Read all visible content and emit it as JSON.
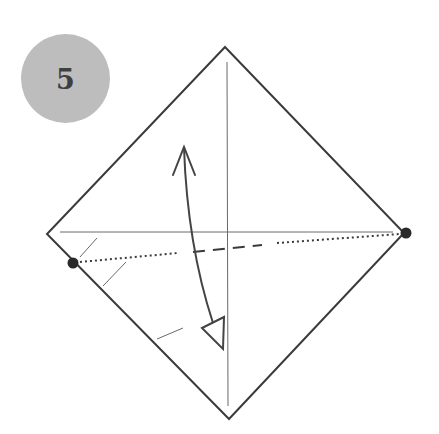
{
  "step": {
    "number": "5",
    "badge_fill": "#bdbdbd",
    "number_color": "#3f3f3f"
  },
  "diagram": {
    "type": "origami-fold-instruction",
    "colors": {
      "outline": "#3a3a3a",
      "crease": "#6a6a6a",
      "fold_line": "#3a3a3a",
      "arrow": "#444444",
      "dot": "#2a2a2a"
    },
    "square": {
      "top": [
        225,
        47
      ],
      "right": [
        404,
        233
      ],
      "bottom": [
        229,
        419
      ],
      "left": [
        47,
        234
      ]
    },
    "creases": {
      "vertical": {
        "from": [
          227,
          62
        ],
        "to": [
          228,
          406
        ]
      },
      "horizontal": {
        "from": [
          60,
          232
        ],
        "to": [
          393,
          232
        ]
      }
    },
    "reference_dots": [
      {
        "name": "left-dot",
        "center": [
          73,
          263
        ],
        "r": 5.5
      },
      {
        "name": "right-dot",
        "center": [
          406,
          233
        ],
        "r": 5.5
      }
    ],
    "fold_line": {
      "dotted_left": {
        "from": [
          80,
          262
        ],
        "to": [
          178,
          253
        ]
      },
      "dashed_middle": {
        "from": [
          193,
          252
        ],
        "to": [
          262,
          245
        ]
      },
      "dotted_right": {
        "from": [
          277,
          243
        ],
        "to": [
          400,
          234
        ]
      }
    },
    "hatch_lines": [
      {
        "from": [
          80,
          257
        ],
        "to": [
          97,
          238
        ]
      },
      {
        "from": [
          103,
          286
        ],
        "to": [
          126,
          262
        ]
      },
      {
        "from": [
          157,
          339
        ],
        "to": [
          183,
          328
        ]
      }
    ],
    "arrow": {
      "path": "M184,148 C186,205 194,265 213,323",
      "head_top": "M173,175 L184,147 L195,175",
      "head_bottom": "M202,328 L224,317 L223,349 Z"
    }
  }
}
